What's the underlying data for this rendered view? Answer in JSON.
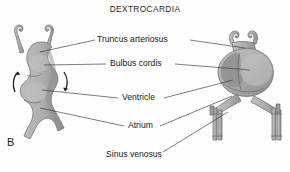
{
  "figure": {
    "title": "DEXTROCARDIA",
    "panel_label": "B",
    "background_color": "#fdfdfd",
    "organ_fill_color": "#b0b0b0",
    "organ_shadow_color": "#8f8f8f",
    "line_color": "#2f2f2f",
    "text_color": "#222222"
  },
  "labels": [
    {
      "id": "truncus-arteriosus",
      "text": "Truncus arteriosus",
      "x": 97,
      "y": 42
    },
    {
      "id": "bulbus-cordis",
      "text": "Bulbus cordis",
      "x": 110,
      "y": 66
    },
    {
      "id": "ventricle",
      "text": "Ventricle",
      "x": 122,
      "y": 100
    },
    {
      "id": "atrium",
      "text": "Atrium",
      "x": 128,
      "y": 128
    },
    {
      "id": "sinus-venosus",
      "text": "Sinus venosus",
      "x": 106,
      "y": 157
    }
  ],
  "panels": [
    {
      "id": "left-heart-tube",
      "description": "straight heart tube with rotation arrows"
    },
    {
      "id": "right-looped-heart",
      "description": "looped heart with paired venous trunks"
    }
  ],
  "annotations": {
    "rotation_arrow_left": "counter-clockwise rotation arrow",
    "rotation_arrow_right": "clockwise rotation arrow"
  }
}
